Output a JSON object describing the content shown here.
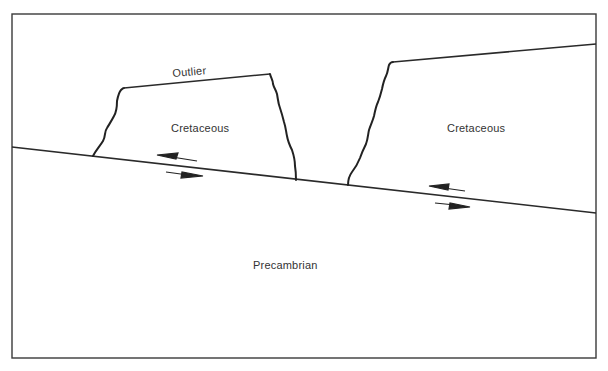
{
  "diagram": {
    "type": "geologic cross-section (thrust fault with outlier / klippe)",
    "labels": {
      "outlier": "Outlier",
      "cretaceous_left": "Cretaceous",
      "cretaceous_right": "Cretaceous",
      "precambrian": "Precambrian"
    },
    "units": [
      {
        "name": "Cretaceous",
        "position": "upper plate, outlier block (left)"
      },
      {
        "name": "Cretaceous",
        "position": "upper plate, main block (right)"
      },
      {
        "name": "Precambrian",
        "position": "lower plate beneath fault"
      }
    ],
    "features": {
      "fault": "low-angle thrust fault dipping to the right",
      "shear_arrows": [
        {
          "location": "left, below outlier",
          "upper_plate_motion": "left",
          "lower_plate_motion": "right"
        },
        {
          "location": "right, below main block",
          "upper_plate_motion": "left",
          "lower_plate_motion": "right"
        }
      ]
    },
    "colors": {
      "line": "#2a2a2a",
      "text": "#333333",
      "background": "#ffffff"
    }
  }
}
